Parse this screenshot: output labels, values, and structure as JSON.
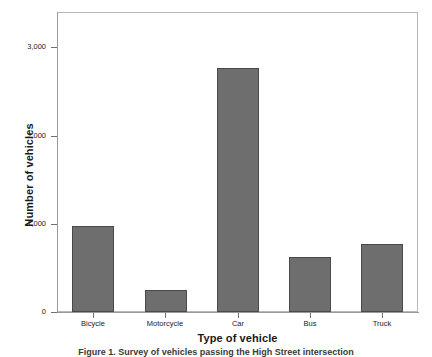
{
  "chart_data": {
    "type": "bar",
    "title": "",
    "xlabel": "Type of vehicle",
    "ylabel": "Number of vehicles",
    "categories": [
      "Bicycle",
      "Motorcycle",
      "Car",
      "Bus",
      "Truck"
    ],
    "values": [
      980,
      250,
      2770,
      625,
      770
    ],
    "ylim": [
      0,
      3400
    ],
    "yticks": [
      0,
      1000,
      2000,
      3000
    ],
    "ytick_labels": [
      "0",
      "1,000",
      "2,000",
      "3,000"
    ],
    "grid": false,
    "legend": "none",
    "bar_color": "#6e6e6e",
    "bar_edge_color": "#4a4a4a",
    "frame_color": "#b9b9b9",
    "axis_color": "#9a9a9a"
  },
  "caption": {
    "text": "Figure 1. Survey of vehicles passing the High Street intersection"
  }
}
